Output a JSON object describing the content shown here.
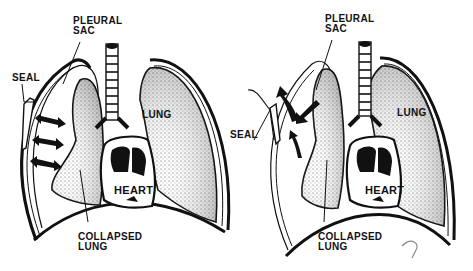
{
  "figure": {
    "panels": [
      {
        "id": "left",
        "description": "Sealed chest with air trapped in pleural sac; arrows show pressure on collapsed lung",
        "labels": {
          "pleural_sac": "PLEURAL\nSAC",
          "seal": "SEAL",
          "lung": "LUNG",
          "heart": "HEART",
          "collapsed_lung": "COLLAPSED\nLUNG"
        }
      },
      {
        "id": "right",
        "description": "Flutter valve seal lets air escape from pleural sac",
        "labels": {
          "pleural_sac": "PLEURAL\nSAC",
          "seal": "SEAL",
          "lung": "LUNG",
          "heart": "HEART",
          "collapsed_lung": "COLLAPSED\nLUNG"
        }
      }
    ],
    "colors": {
      "ink": "#111111",
      "background": "#ffffff",
      "stipple": "#9a9a9a"
    }
  }
}
